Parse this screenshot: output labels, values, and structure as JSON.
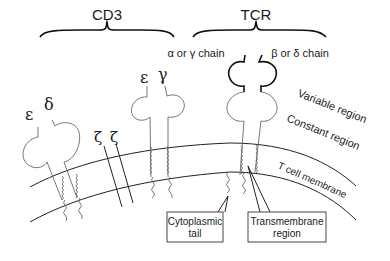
{
  "groups": {
    "cd3": {
      "label": "CD3"
    },
    "tcr": {
      "label": "TCR"
    }
  },
  "chains": {
    "epsilon_1": "ε",
    "delta": "δ",
    "zeta_1": "ζ",
    "zeta_2": "ζ",
    "epsilon_2": "ε",
    "gamma": "γ",
    "alpha_gamma": "α or γ chain",
    "beta_delta": "β or δ chain"
  },
  "regions": {
    "variable": "Variable region",
    "constant": "Constant region",
    "membrane": "T cell membrane"
  },
  "callouts": {
    "cytoplasmic_line1": "Cytoplasmic",
    "cytoplasmic_line2": "tail",
    "transmembrane_line1": "Transmembrane",
    "transmembrane_line2": "region"
  }
}
